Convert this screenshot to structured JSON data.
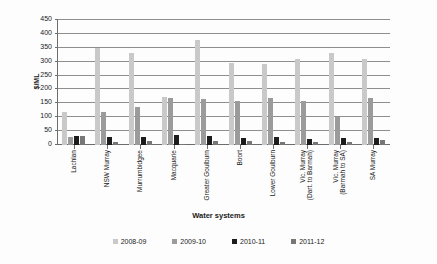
{
  "chart_data": {
    "type": "bar",
    "title": "",
    "xlabel": "Water systems",
    "ylabel": "$/ML",
    "ylim": [
      0,
      450
    ],
    "ytick_step": 50,
    "yticks": [
      450,
      400,
      350,
      300,
      250,
      200,
      150,
      100,
      50,
      0
    ],
    "grid": true,
    "legend_position": "bottom",
    "categories": [
      "Lachlan",
      "NSW Murray",
      "Murrumbidgee",
      "Macquarie",
      "Greater Goulburn",
      "Boort",
      "Lower Goulburn",
      "Vic. Murray (Dart. to Barmah)",
      "Vic. Murray (Barmah to SA)",
      "SA Murray"
    ],
    "category_lines": [
      [
        "Lachlan"
      ],
      [
        "NSW Murray"
      ],
      [
        "Murrumbidgee"
      ],
      [
        "Macquarie"
      ],
      [
        "Greater Goulburn"
      ],
      [
        "Boort"
      ],
      [
        "Lower Goulburn"
      ],
      [
        "Vic. Murray",
        "(Dart. to Barmah)"
      ],
      [
        "Vic. Murray",
        "(Barmah to SA)"
      ],
      [
        "SA Murray"
      ]
    ],
    "series": [
      {
        "name": "2008-09",
        "color": "#c9c9c9",
        "values": [
          120,
          350,
          332,
          172,
          378,
          295,
          292,
          310,
          330,
          310
        ]
      },
      {
        "name": "2009-10",
        "color": "#9b9b9b",
        "values": [
          28,
          118,
          137,
          168,
          165,
          160,
          170,
          158,
          100,
          168
        ]
      },
      {
        "name": "2010-11",
        "color": "#1c1c1c",
        "values": [
          33,
          30,
          30,
          35,
          33,
          25,
          30,
          22,
          25,
          25
        ]
      },
      {
        "name": "2011-12",
        "color": "#777777",
        "values": [
          33,
          12,
          16,
          3,
          15,
          15,
          12,
          10,
          12,
          18
        ]
      }
    ]
  },
  "legend": {
    "items": [
      {
        "label": "2008-09",
        "color": "#c9c9c9"
      },
      {
        "label": "2009-10",
        "color": "#9b9b9b"
      },
      {
        "label": "2010-11",
        "color": "#1c1c1c"
      },
      {
        "label": "2011-12",
        "color": "#777777"
      }
    ]
  }
}
